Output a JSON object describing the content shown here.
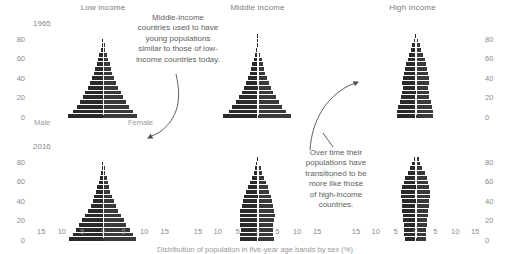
{
  "figure": {
    "caption": "Distribution of population in five-year age bands by sex (%)",
    "bar_color": "#2b2b2b",
    "text_color": "#6b6b6b"
  },
  "columns": [
    {
      "key": "low",
      "label": "Low income"
    },
    {
      "key": "middle",
      "label": "Middle income"
    },
    {
      "key": "high",
      "label": "High income"
    }
  ],
  "rows": [
    {
      "key": "r1965",
      "label": "1965"
    },
    {
      "key": "r2016",
      "label": "2016"
    }
  ],
  "sex_labels": {
    "male": "Male",
    "female": "Female"
  },
  "axes": {
    "y_ticks": [
      "80",
      "60",
      "40",
      "20",
      "0"
    ],
    "y_values": [
      80,
      60,
      40,
      20,
      0
    ],
    "y_range": [
      0,
      90
    ],
    "x_ticks": [
      "15",
      "10",
      "5",
      "0",
      "5",
      "10",
      "15"
    ],
    "x_values": [
      15,
      10,
      5,
      0,
      5,
      10,
      15
    ],
    "x_range": [
      -17,
      17
    ]
  },
  "annotations": [
    {
      "id": "annot-middle-income",
      "text": "Middle-income\ncountries used to have\nyoung populations\nsimilar to those of low-\nincome countries today."
    },
    {
      "id": "annot-transition",
      "text": "Over time their\npopulations have\ntransitioned to be\nmore like those\nof high-income\ncountries."
    }
  ],
  "chart_data": {
    "type": "bar",
    "subtype": "population-pyramid-small-multiples",
    "title": "",
    "xlabel": "Distribution of population in five-year age bands by sex (%)",
    "ylabel": "Age",
    "xlim": [
      -17,
      17
    ],
    "ylim": [
      0,
      90
    ],
    "grid": false,
    "legend": [
      "Male",
      "Female"
    ],
    "legend_position": "inline-axis",
    "age_bands": [
      "0-4",
      "5-9",
      "10-14",
      "15-19",
      "20-24",
      "25-29",
      "30-34",
      "35-39",
      "40-44",
      "45-49",
      "50-54",
      "55-59",
      "60-64",
      "65-69",
      "70-74",
      "75-79",
      "80-84",
      "85+"
    ],
    "panels": [
      {
        "column": "Low income",
        "row": "1965",
        "male": [
          8.4,
          7.3,
          6.4,
          5.6,
          4.9,
          4.3,
          3.7,
          3.2,
          2.7,
          2.3,
          1.9,
          1.5,
          1.2,
          0.9,
          0.6,
          0.35,
          0.18,
          0.07
        ],
        "female": [
          8.3,
          7.2,
          6.3,
          5.5,
          4.9,
          4.3,
          3.7,
          3.2,
          2.7,
          2.3,
          1.9,
          1.6,
          1.2,
          0.9,
          0.6,
          0.38,
          0.2,
          0.08
        ]
      },
      {
        "column": "Low income",
        "row": "2016",
        "male": [
          8.2,
          7.4,
          6.6,
          5.8,
          5.0,
          4.3,
          3.6,
          3.0,
          2.5,
          2.1,
          1.7,
          1.35,
          1.05,
          0.8,
          0.55,
          0.33,
          0.16,
          0.06
        ],
        "female": [
          8.1,
          7.3,
          6.5,
          5.7,
          5.0,
          4.3,
          3.7,
          3.1,
          2.6,
          2.2,
          1.8,
          1.45,
          1.15,
          0.88,
          0.6,
          0.37,
          0.19,
          0.08
        ]
      },
      {
        "column": "Middle income",
        "row": "1965",
        "male": [
          8.6,
          7.3,
          6.3,
          5.5,
          4.7,
          4.0,
          3.4,
          2.9,
          2.4,
          2.0,
          1.6,
          1.3,
          1.0,
          0.7,
          0.45,
          0.25,
          0.11,
          0.04
        ],
        "female": [
          8.4,
          7.1,
          6.2,
          5.4,
          4.6,
          4.0,
          3.4,
          2.9,
          2.4,
          2.0,
          1.7,
          1.35,
          1.05,
          0.75,
          0.5,
          0.28,
          0.13,
          0.05
        ]
      },
      {
        "column": "Middle income",
        "row": "2016",
        "male": [
          4.4,
          4.3,
          4.2,
          4.3,
          4.5,
          4.5,
          4.3,
          4.0,
          3.7,
          3.4,
          3.0,
          2.5,
          2.0,
          1.5,
          1.0,
          0.65,
          0.35,
          0.13
        ],
        "female": [
          4.1,
          4.0,
          3.9,
          4.0,
          4.2,
          4.3,
          4.2,
          3.9,
          3.6,
          3.3,
          3.0,
          2.6,
          2.1,
          1.6,
          1.15,
          0.8,
          0.45,
          0.2
        ]
      },
      {
        "column": "High income",
        "row": "1965",
        "male": [
          4.6,
          4.6,
          4.4,
          4.0,
          3.6,
          3.4,
          3.2,
          3.3,
          3.2,
          3.0,
          2.7,
          2.4,
          2.0,
          1.6,
          1.2,
          0.8,
          0.4,
          0.14
        ],
        "female": [
          4.4,
          4.4,
          4.2,
          3.9,
          3.5,
          3.3,
          3.2,
          3.3,
          3.3,
          3.1,
          2.9,
          2.6,
          2.3,
          1.9,
          1.5,
          1.1,
          0.6,
          0.25
        ]
      },
      {
        "column": "High income",
        "row": "2016",
        "male": [
          2.7,
          2.8,
          2.8,
          2.9,
          3.1,
          3.2,
          3.3,
          3.3,
          3.4,
          3.6,
          3.6,
          3.4,
          3.0,
          2.6,
          2.0,
          1.4,
          0.9,
          0.5
        ],
        "female": [
          2.6,
          2.7,
          2.7,
          2.8,
          3.0,
          3.1,
          3.2,
          3.3,
          3.4,
          3.6,
          3.7,
          3.5,
          3.2,
          2.8,
          2.3,
          1.7,
          1.2,
          0.9
        ]
      }
    ]
  }
}
